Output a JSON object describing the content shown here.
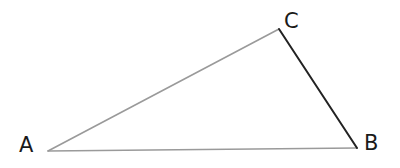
{
  "diagram": {
    "type": "triangle",
    "vertices": [
      {
        "label": "A",
        "x": 48,
        "y": 151,
        "label_x": 19,
        "label_y": 152
      },
      {
        "label": "B",
        "x": 357,
        "y": 148,
        "label_x": 364,
        "label_y": 150
      },
      {
        "label": "C",
        "x": 279,
        "y": 29,
        "label_x": 284,
        "label_y": 28
      }
    ],
    "sides": [
      {
        "from": "A",
        "to": "C",
        "color": "#9a9a9a",
        "width": 1.6
      },
      {
        "from": "A",
        "to": "B",
        "color": "#9a9a9a",
        "width": 1.6
      },
      {
        "from": "C",
        "to": "B",
        "color": "#222222",
        "width": 2
      }
    ]
  }
}
